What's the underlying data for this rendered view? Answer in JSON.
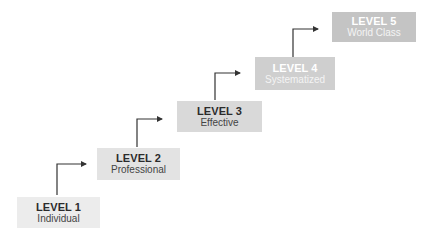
{
  "diagram": {
    "type": "staircase-maturity-model",
    "levels": [
      {
        "title": "LEVEL 1",
        "subtitle": "Individual",
        "box": {
          "x": 17,
          "y": 197,
          "w": 83,
          "h": 31
        },
        "bg": "#ececec",
        "text_color": "#2b2b2b",
        "sub_color": "#444444"
      },
      {
        "title": "LEVEL 2",
        "subtitle": "Professional",
        "box": {
          "x": 97,
          "y": 148,
          "w": 83,
          "h": 32
        },
        "bg": "#e3e3e3",
        "text_color": "#2b2b2b",
        "sub_color": "#444444"
      },
      {
        "title": "LEVEL 3",
        "subtitle": "Effective",
        "box": {
          "x": 177,
          "y": 101,
          "w": 85,
          "h": 31
        },
        "bg": "#d9d9d9",
        "text_color": "#2b2b2b",
        "sub_color": "#444444"
      },
      {
        "title": "LEVEL 4",
        "subtitle": "Systematized",
        "box": {
          "x": 255,
          "y": 57,
          "w": 80,
          "h": 33
        },
        "bg": "#cfcfcf",
        "text_color": "#ffffff",
        "sub_color": "#f4f4f4"
      },
      {
        "title": "LEVEL 5",
        "subtitle": "World Class",
        "box": {
          "x": 332,
          "y": 12,
          "w": 84,
          "h": 30
        },
        "bg": "#c4c4c4",
        "text_color": "#ffffff",
        "sub_color": "#f4f4f4"
      }
    ],
    "arrows": [
      {
        "x": 57,
        "y_start": 195,
        "y_corner": 164,
        "x_end": 86
      },
      {
        "x": 137,
        "y_start": 147,
        "y_corner": 119,
        "x_end": 162
      },
      {
        "x": 215,
        "y_start": 100,
        "y_corner": 73,
        "x_end": 240
      },
      {
        "x": 293,
        "y_start": 57,
        "y_corner": 29,
        "x_end": 318
      }
    ],
    "arrow_color": "#333333"
  }
}
